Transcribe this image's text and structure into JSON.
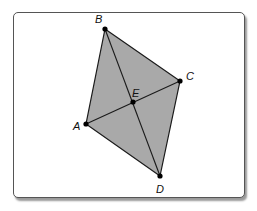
{
  "figure": {
    "title": "",
    "fill_color": "#a9a9a9",
    "line_color": "#1a1a1a",
    "points": [
      {
        "name": "A",
        "x": 86,
        "y": 124,
        "lx": 74,
        "ly": 130
      },
      {
        "name": "B",
        "x": 105,
        "y": 29,
        "lx": 95,
        "ly": 23
      },
      {
        "name": "C",
        "x": 180,
        "y": 81,
        "lx": 186,
        "ly": 79
      },
      {
        "name": "D",
        "x": 160,
        "y": 176,
        "lx": 157,
        "ly": 192
      },
      {
        "name": "E",
        "x": 133,
        "y": 102,
        "lx": 133,
        "ly": 96
      }
    ],
    "labels": {
      "A": "A",
      "B": "B",
      "C": "C",
      "D": "D",
      "E": "E"
    }
  }
}
